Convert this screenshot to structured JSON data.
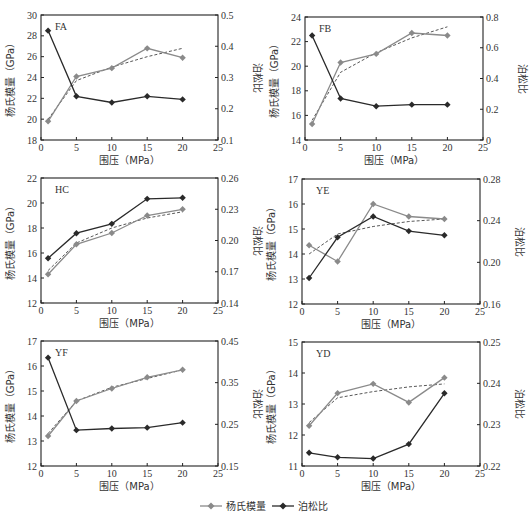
{
  "legend": {
    "items": [
      {
        "label": "杨氏模量",
        "color": "#8a8a8a"
      },
      {
        "label": "泊松比",
        "color": "#2a2a2a"
      }
    ]
  },
  "axes_text": {
    "xlabel": "围压（MPa）",
    "ylabel_left": "杨氏模量（GPa）",
    "ylabel_right": "泊松比"
  },
  "colors": {
    "youngs": "#8a8a8a",
    "poisson": "#2a2a2a",
    "trend": "#444444",
    "frame": "#222222"
  },
  "chart_data": [
    {
      "type": "line",
      "title": "FA",
      "xlabel": "围压（MPa）",
      "ylabel": "杨氏模量（GPa）",
      "ylabel_right": "泊松比",
      "x": [
        1,
        5,
        10,
        15,
        20
      ],
      "xlim": [
        0,
        25
      ],
      "xticks": [
        0,
        5,
        10,
        15,
        20,
        25
      ],
      "ylim": [
        18,
        30
      ],
      "yticks": [
        18,
        20,
        22,
        24,
        26,
        28,
        30
      ],
      "ylim_right": [
        0.1,
        0.5
      ],
      "yticks_right": [
        "0.1",
        "0.2",
        "0.3",
        "0.4",
        "0.5"
      ],
      "series": [
        {
          "name": "杨氏模量",
          "axis": "left",
          "values": [
            19.8,
            24.1,
            24.9,
            26.8,
            25.9
          ]
        },
        {
          "name": "泊松比",
          "axis": "right",
          "values": [
            0.45,
            0.24,
            0.22,
            0.24,
            0.23
          ]
        }
      ],
      "trend": {
        "axis": "left",
        "values": [
          20.0,
          23.7,
          25.0,
          26.0,
          26.8
        ]
      },
      "frame": {
        "left": 41,
        "top": 15,
        "width": 177,
        "height": 125
      }
    },
    {
      "type": "line",
      "title": "FB",
      "xlabel": "围压（MPa）",
      "ylabel": "杨氏模量（GPa）",
      "ylabel_right": "泊松比",
      "x": [
        1,
        5,
        10,
        15,
        20
      ],
      "xlim": [
        0,
        25
      ],
      "xticks": [
        0,
        5,
        10,
        15,
        20,
        25
      ],
      "ylim": [
        14,
        24
      ],
      "yticks": [
        14,
        16,
        18,
        20,
        22,
        24
      ],
      "ylim_right": [
        0,
        0.8
      ],
      "yticks_right": [
        "0",
        "0.2",
        "0.4",
        "0.6",
        "0.8"
      ],
      "series": [
        {
          "name": "杨氏模量",
          "axis": "left",
          "values": [
            15.3,
            20.3,
            21.0,
            22.7,
            22.5
          ]
        },
        {
          "name": "泊松比",
          "axis": "right",
          "values": [
            0.68,
            0.27,
            0.22,
            0.23,
            0.23
          ]
        }
      ],
      "trend": {
        "axis": "left",
        "values": [
          15.6,
          19.5,
          21.1,
          22.3,
          23.2
        ]
      },
      "frame": {
        "left": 305,
        "top": 17,
        "width": 178,
        "height": 123
      }
    },
    {
      "type": "line",
      "title": "HC",
      "xlabel": "围压（MPa）",
      "ylabel": "杨氏模量（GPa）",
      "ylabel_right": "泊松比",
      "x": [
        1,
        5,
        10,
        15,
        20
      ],
      "xlim": [
        0,
        25
      ],
      "xticks": [
        0,
        5,
        10,
        15,
        20,
        25
      ],
      "ylim": [
        12,
        22
      ],
      "yticks": [
        12,
        14,
        16,
        18,
        20,
        22
      ],
      "ylim_right": [
        0.14,
        0.26
      ],
      "yticks_right": [
        "0.14",
        "0.17",
        "0.20",
        "0.23",
        "0.26"
      ],
      "series": [
        {
          "name": "杨氏模量",
          "axis": "left",
          "values": [
            14.3,
            16.7,
            17.6,
            19.0,
            19.5
          ]
        },
        {
          "name": "泊松比",
          "axis": "right",
          "values": [
            0.183,
            0.207,
            0.216,
            0.24,
            0.241
          ]
        }
      ],
      "trend": {
        "axis": "left",
        "values": [
          14.6,
          16.8,
          18.0,
          18.8,
          19.3
        ]
      },
      "frame": {
        "left": 41,
        "top": 178,
        "width": 177,
        "height": 125
      }
    },
    {
      "type": "line",
      "title": "YE",
      "xlabel": "围压（MPa）",
      "ylabel": "杨氏模量（GPa）",
      "ylabel_right": "泊松比",
      "x": [
        1,
        5,
        10,
        15,
        20
      ],
      "xlim": [
        0,
        25
      ],
      "xticks": [
        0,
        5,
        10,
        15,
        20,
        25
      ],
      "ylim": [
        12,
        17
      ],
      "yticks": [
        12,
        13,
        14,
        15,
        16,
        17
      ],
      "ylim_right": [
        0.16,
        0.28
      ],
      "yticks_right": [
        "0.16",
        "0.20",
        "0.24",
        "0.28"
      ],
      "series": [
        {
          "name": "杨氏模量",
          "axis": "left",
          "values": [
            14.35,
            13.7,
            16.0,
            15.5,
            15.4
          ]
        },
        {
          "name": "泊松比",
          "axis": "right",
          "values": [
            0.185,
            0.224,
            0.244,
            0.23,
            0.226
          ]
        }
      ],
      "trend": {
        "axis": "left",
        "values": [
          14.0,
          14.8,
          15.1,
          15.3,
          15.4
        ]
      },
      "frame": {
        "left": 302,
        "top": 179,
        "width": 178,
        "height": 125
      }
    },
    {
      "type": "line",
      "title": "YF",
      "xlabel": "围压（MPa）",
      "ylabel": "杨氏模量（GPa）",
      "ylabel_right": "泊松比",
      "x": [
        1,
        5,
        10,
        15,
        20
      ],
      "xlim": [
        0,
        25
      ],
      "xticks": [
        0,
        5,
        10,
        15,
        20,
        25
      ],
      "ylim": [
        12,
        17
      ],
      "yticks": [
        12,
        13,
        14,
        15,
        16,
        17
      ],
      "ylim_right": [
        0.15,
        0.45
      ],
      "yticks_right": [
        "0.15",
        "0.25",
        "0.35",
        "0.45"
      ],
      "series": [
        {
          "name": "杨氏模量",
          "axis": "left",
          "values": [
            13.2,
            14.6,
            15.1,
            15.55,
            15.85
          ]
        },
        {
          "name": "泊松比",
          "axis": "right",
          "values": [
            0.41,
            0.236,
            0.24,
            0.242,
            0.254
          ]
        }
      ],
      "trend": {
        "axis": "left",
        "values": [
          13.3,
          14.6,
          15.15,
          15.5,
          15.85
        ]
      },
      "frame": {
        "left": 41,
        "top": 341,
        "width": 177,
        "height": 125
      }
    },
    {
      "type": "line",
      "title": "YD",
      "xlabel": "围压（MPa）",
      "ylabel": "杨氏模量（GPa）",
      "ylabel_right": "泊松比",
      "x": [
        1,
        5,
        10,
        15,
        20
      ],
      "xlim": [
        0,
        25
      ],
      "xticks": [
        0,
        5,
        10,
        15,
        20,
        25
      ],
      "ylim": [
        11,
        15
      ],
      "yticks": [
        11,
        12,
        13,
        14,
        15
      ],
      "ylim_right": [
        0.22,
        0.25
      ],
      "yticks_right": [
        "0.22",
        "0.23",
        "0.24",
        "0.25"
      ],
      "series": [
        {
          "name": "杨氏模量",
          "axis": "left",
          "values": [
            12.3,
            13.35,
            13.65,
            13.05,
            13.85
          ]
        },
        {
          "name": "泊松比",
          "axis": "right",
          "values": [
            0.2232,
            0.2221,
            0.2218,
            0.2253,
            0.2376
          ]
        }
      ],
      "trend": {
        "axis": "left",
        "values": [
          12.4,
          13.2,
          13.4,
          13.55,
          13.65
        ]
      },
      "frame": {
        "left": 302,
        "top": 342,
        "width": 178,
        "height": 124
      }
    }
  ]
}
